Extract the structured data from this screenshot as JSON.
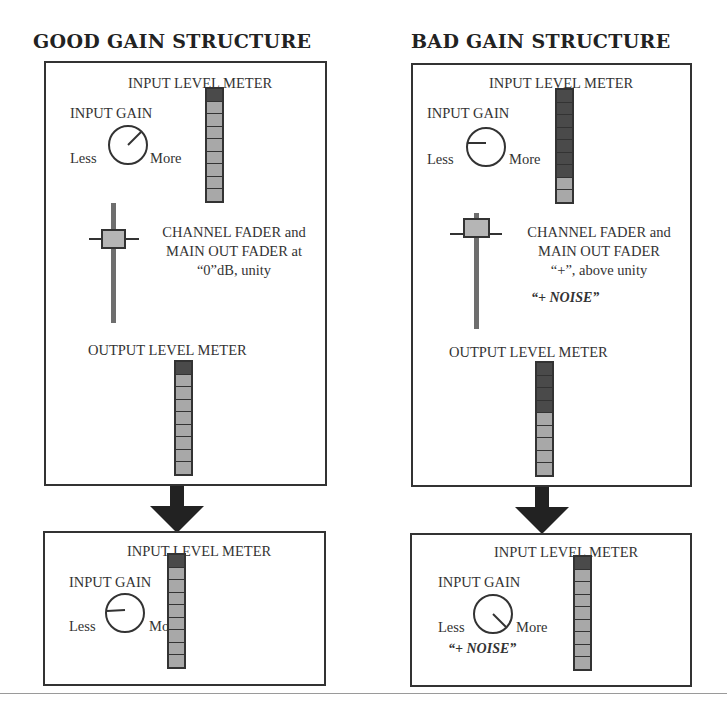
{
  "panels": {
    "good": {
      "title": "GOOD GAIN STRUCTURE",
      "top": {
        "input_meter_label": "INPUT LEVEL METER",
        "input_gain_label": "INPUT GAIN",
        "knob_less": "Less",
        "knob_more": "More",
        "knob_angle_deg": 45,
        "input_meter_segments": [
          "on",
          "off",
          "off",
          "off",
          "off",
          "off",
          "off",
          "off",
          "off"
        ],
        "fader_line1": "CHANNEL FADER and",
        "fader_line2": "MAIN OUT FADER at",
        "fader_line3": "“0”dB, unity",
        "fader_position": "unity",
        "output_meter_label": "OUTPUT LEVEL METER",
        "output_meter_segments": [
          "on",
          "off",
          "off",
          "off",
          "off",
          "off",
          "off",
          "off",
          "off"
        ]
      },
      "bottom": {
        "input_meter_label": "INPUT LEVEL METER",
        "input_gain_label": "INPUT GAIN",
        "knob_less": "Less",
        "knob_more": "More",
        "knob_angle_deg": 0,
        "input_meter_segments": [
          "on",
          "off",
          "off",
          "off",
          "off",
          "off",
          "off",
          "off",
          "off"
        ]
      }
    },
    "bad": {
      "title": "BAD GAIN STRUCTURE",
      "top": {
        "input_meter_label": "INPUT LEVEL METER",
        "input_gain_label": "INPUT GAIN",
        "knob_less": "Less",
        "knob_more": "More",
        "knob_angle_deg": 0,
        "input_meter_segments": [
          "on",
          "on",
          "on",
          "on",
          "on",
          "on",
          "on",
          "off",
          "off"
        ],
        "fader_line1": "CHANNEL FADER and",
        "fader_line2": "MAIN OUT FADER",
        "fader_line3": "“+”, above unity",
        "fader_noise": "“+ NOISE”",
        "fader_position": "above-unity",
        "output_meter_label": "OUTPUT LEVEL METER",
        "output_meter_segments": [
          "on",
          "on",
          "on",
          "on",
          "off",
          "off",
          "off",
          "off",
          "off"
        ]
      },
      "bottom": {
        "input_meter_label": "INPUT LEVEL METER",
        "input_gain_label": "INPUT GAIN",
        "knob_less": "Less",
        "knob_more": "More",
        "knob_angle_deg": -45,
        "knob_noise": "“+ NOISE”",
        "input_meter_segments": [
          "on",
          "off",
          "off",
          "off",
          "off",
          "off",
          "off",
          "off",
          "off"
        ]
      }
    }
  },
  "colors": {
    "stroke": "#333333",
    "meter_on": "#4a4a4a",
    "meter_off": "#a8a8a8",
    "fader_cap": "#b5b5b5",
    "fader_track": "#6e6e6e",
    "arrow": "#222222"
  }
}
